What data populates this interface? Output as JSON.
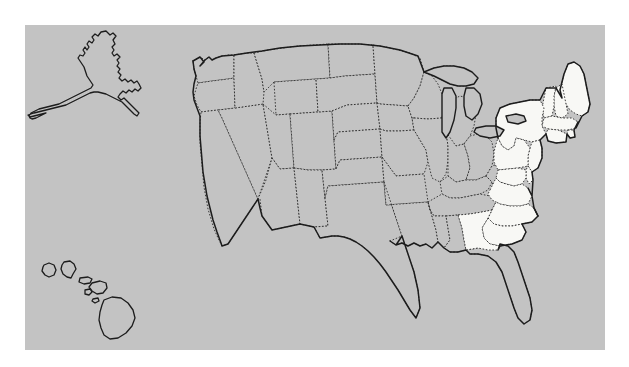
{
  "figure": {
    "type": "choropleth-map",
    "title": "",
    "caption": ""
  },
  "colors": {
    "panel_background": "#c3c3c3",
    "page_background": "#ffffff",
    "state_default_fill": "#c3c3c3",
    "state_highlight_fill": "#f8f8f5",
    "internal_border": "#2b2b2b",
    "national_border": "#1c1c1c"
  },
  "panel": {
    "x": 25,
    "y": 25,
    "width": 580,
    "height": 325
  },
  "legend": {
    "visible": false,
    "entries": [
      {
        "label": "Highlighted",
        "swatch": "#f8f8f5"
      },
      {
        "label": "Not highlighted",
        "swatch": "#c3c3c3"
      }
    ]
  },
  "map_data": {
    "projection": "albers-usa-style",
    "border_style_internal": "dotted",
    "border_style_national": "solid",
    "highlighted_count": 15,
    "total_regions": 51,
    "insets": [
      {
        "name": "Alaska",
        "code": "AK",
        "highlighted": false
      },
      {
        "name": "Hawaii",
        "code": "HI",
        "highlighted": false
      }
    ],
    "highlighted_regions": [
      {
        "name": "Maine",
        "code": "ME"
      },
      {
        "name": "New Hampshire",
        "code": "NH"
      },
      {
        "name": "Vermont",
        "code": "VT"
      },
      {
        "name": "Massachusetts",
        "code": "MA"
      },
      {
        "name": "Rhode Island",
        "code": "RI"
      },
      {
        "name": "Connecticut",
        "code": "CT"
      },
      {
        "name": "New York",
        "code": "NY"
      },
      {
        "name": "New Jersey",
        "code": "NJ"
      },
      {
        "name": "Pennsylvania",
        "code": "PA"
      },
      {
        "name": "Delaware",
        "code": "DE"
      },
      {
        "name": "Maryland",
        "code": "MD"
      },
      {
        "name": "Virginia",
        "code": "VA"
      },
      {
        "name": "North Carolina",
        "code": "NC"
      },
      {
        "name": "South Carolina",
        "code": "SC"
      },
      {
        "name": "Georgia",
        "code": "GA"
      }
    ],
    "unhighlighted_regions": [
      {
        "name": "Washington",
        "code": "WA"
      },
      {
        "name": "Oregon",
        "code": "OR"
      },
      {
        "name": "California",
        "code": "CA"
      },
      {
        "name": "Nevada",
        "code": "NV"
      },
      {
        "name": "Idaho",
        "code": "ID"
      },
      {
        "name": "Montana",
        "code": "MT"
      },
      {
        "name": "Wyoming",
        "code": "WY"
      },
      {
        "name": "Utah",
        "code": "UT"
      },
      {
        "name": "Arizona",
        "code": "AZ"
      },
      {
        "name": "New Mexico",
        "code": "NM"
      },
      {
        "name": "Colorado",
        "code": "CO"
      },
      {
        "name": "North Dakota",
        "code": "ND"
      },
      {
        "name": "South Dakota",
        "code": "SD"
      },
      {
        "name": "Nebraska",
        "code": "NE"
      },
      {
        "name": "Kansas",
        "code": "KS"
      },
      {
        "name": "Oklahoma",
        "code": "OK"
      },
      {
        "name": "Texas",
        "code": "TX"
      },
      {
        "name": "Minnesota",
        "code": "MN"
      },
      {
        "name": "Iowa",
        "code": "IA"
      },
      {
        "name": "Missouri",
        "code": "MO"
      },
      {
        "name": "Arkansas",
        "code": "AR"
      },
      {
        "name": "Louisiana",
        "code": "LA"
      },
      {
        "name": "Wisconsin",
        "code": "WI"
      },
      {
        "name": "Illinois",
        "code": "IL"
      },
      {
        "name": "Michigan",
        "code": "MI"
      },
      {
        "name": "Indiana",
        "code": "IN"
      },
      {
        "name": "Ohio",
        "code": "OH"
      },
      {
        "name": "Kentucky",
        "code": "KY"
      },
      {
        "name": "Tennessee",
        "code": "TN"
      },
      {
        "name": "Mississippi",
        "code": "MS"
      },
      {
        "name": "Alabama",
        "code": "AL"
      },
      {
        "name": "Florida",
        "code": "FL"
      },
      {
        "name": "West Virginia",
        "code": "WV"
      }
    ],
    "water_features": [
      {
        "name": "Lake Superior"
      },
      {
        "name": "Lake Michigan"
      },
      {
        "name": "Lake Huron"
      },
      {
        "name": "Lake Erie"
      },
      {
        "name": "Lake Ontario"
      }
    ]
  }
}
